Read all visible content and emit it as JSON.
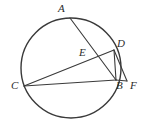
{
  "figure": {
    "background_color": "#ffffff",
    "stroke_color": "#3a3a3a",
    "label_color": "#2b2b2b"
  },
  "labels": {
    "a": "A",
    "b": "B",
    "c": "C",
    "d": "D",
    "e": "E",
    "f": "F"
  },
  "chart_data": {
    "type": "diagram",
    "circle": {
      "cx": 71,
      "cy": 68,
      "r": 50
    },
    "points": [
      {
        "name": "A",
        "x": 70,
        "y": 18,
        "on_circle": true,
        "label_x": 58,
        "label_y": 3
      },
      {
        "name": "B",
        "x": 116,
        "y": 80,
        "on_circle": true,
        "label_x": 116,
        "label_y": 80
      },
      {
        "name": "C",
        "x": 24,
        "y": 86,
        "on_circle": true,
        "label_x": 11,
        "label_y": 80
      },
      {
        "name": "D",
        "x": 114,
        "y": 50,
        "on_circle": true,
        "label_x": 117,
        "label_y": 38
      },
      {
        "name": "E",
        "x": 92,
        "y": 57,
        "on_circle": false,
        "label_x": 79,
        "label_y": 47
      },
      {
        "name": "F",
        "x": 127,
        "y": 81,
        "on_circle": false,
        "label_x": 130,
        "label_y": 80
      }
    ],
    "segments": [
      {
        "name": "AB",
        "from": "A",
        "to": "B"
      },
      {
        "name": "CD",
        "from": "C",
        "to": "D"
      },
      {
        "name": "CB",
        "from": "C",
        "to": "B"
      },
      {
        "name": "DB",
        "from": "D",
        "to": "B"
      },
      {
        "name": "DF",
        "from": "D",
        "to": "F"
      },
      {
        "name": "BF",
        "from": "B",
        "to": "F"
      }
    ]
  }
}
